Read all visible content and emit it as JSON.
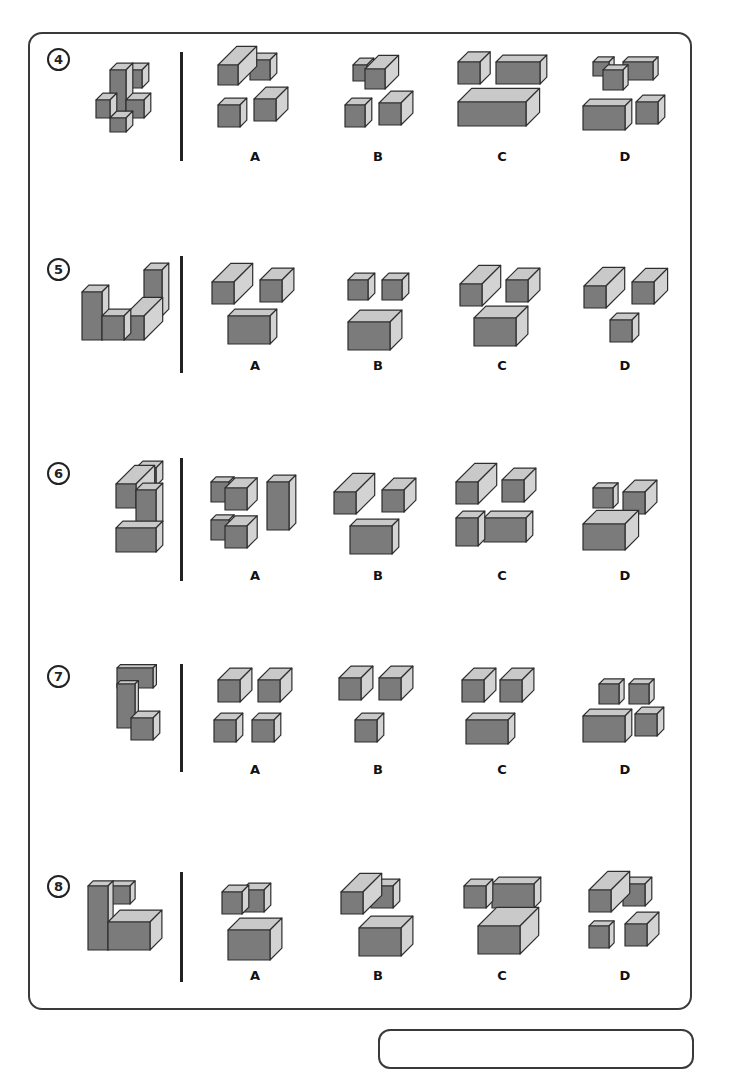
{
  "colors": {
    "front": "#7b7b7b",
    "top": "#c9c9c9",
    "side": "#d3d3d3",
    "outline": "#2e2e2e",
    "frame": "#3a3a3a"
  },
  "option_labels": [
    "A",
    "B",
    "C",
    "D"
  ],
  "questions": [
    {
      "number": "4",
      "circle_y": 48,
      "divider": [
        52,
        161
      ],
      "label_y": 149,
      "target": {
        "origin": [
          96,
          70
        ],
        "boxes": [
          [
            0,
            30,
            14,
            18,
            8
          ],
          [
            30,
            30,
            18,
            18,
            8
          ],
          [
            14,
            0,
            16,
            48,
            8
          ],
          [
            30,
            0,
            16,
            18,
            8
          ],
          [
            14,
            48,
            16,
            14,
            8
          ]
        ]
      },
      "options": [
        {
          "origin": [
            218,
            55
          ],
          "boxes": [
            [
              0,
              10,
              20,
              20,
              22
            ],
            [
              32,
              5,
              20,
              20,
              8
            ],
            [
              0,
              50,
              22,
              22,
              8
            ],
            [
              36,
              44,
              22,
              22,
              14
            ]
          ]
        },
        {
          "origin": [
            345,
            55
          ],
          "boxes": [
            [
              8,
              10,
              14,
              16,
              8
            ],
            [
              20,
              14,
              20,
              20,
              16
            ],
            [
              0,
              50,
              20,
              22,
              8
            ],
            [
              34,
              48,
              22,
              22,
              14
            ]
          ]
        },
        {
          "origin": [
            458,
            52
          ],
          "boxes": [
            [
              0,
              10,
              22,
              22,
              12
            ],
            [
              38,
              10,
              44,
              22,
              8
            ],
            [
              0,
              50,
              68,
              24,
              16
            ]
          ]
        },
        {
          "origin": [
            583,
            56
          ],
          "boxes": [
            [
              10,
              6,
              16,
              14,
              6
            ],
            [
              20,
              14,
              20,
              20,
              6
            ],
            [
              40,
              6,
              30,
              18,
              6
            ],
            [
              0,
              50,
              42,
              24,
              8
            ],
            [
              53,
              46,
              22,
              22,
              8
            ]
          ]
        }
      ]
    },
    {
      "number": "5",
      "circle_y": 258,
      "divider": [
        256,
        373
      ],
      "label_y": 358,
      "target": {
        "origin": [
          82,
          260
        ],
        "boxes": [
          [
            0,
            32,
            20,
            48,
            8
          ],
          [
            20,
            56,
            22,
            24,
            8
          ],
          [
            42,
            56,
            20,
            24,
            22
          ],
          [
            62,
            10,
            18,
            46,
            8
          ]
        ]
      },
      "options": [
        {
          "origin": [
            212,
            268
          ],
          "boxes": [
            [
              0,
              14,
              22,
              22,
              22
            ],
            [
              48,
              12,
              22,
              22,
              14
            ],
            [
              16,
              48,
              42,
              28,
              8
            ]
          ]
        },
        {
          "origin": [
            348,
            272
          ],
          "boxes": [
            [
              0,
              8,
              20,
              20,
              8
            ],
            [
              34,
              8,
              20,
              20,
              8
            ],
            [
              0,
              50,
              42,
              28,
              14
            ]
          ]
        },
        {
          "origin": [
            460,
            268
          ],
          "boxes": [
            [
              0,
              16,
              22,
              22,
              22
            ],
            [
              46,
              12,
              22,
              22,
              14
            ],
            [
              14,
              50,
              42,
              28,
              14
            ]
          ]
        },
        {
          "origin": [
            584,
            268
          ],
          "boxes": [
            [
              0,
              18,
              22,
              22,
              22
            ],
            [
              48,
              14,
              22,
              22,
              16
            ],
            [
              26,
              52,
              22,
              22,
              8
            ]
          ]
        }
      ]
    },
    {
      "number": "6",
      "circle_y": 462,
      "divider": [
        458,
        581
      ],
      "label_y": 568,
      "target": {
        "origin": [
          116,
          460
        ],
        "boxes": [
          [
            0,
            68,
            40,
            24,
            8
          ],
          [
            20,
            30,
            20,
            38,
            8
          ],
          [
            0,
            24,
            20,
            24,
            22
          ],
          [
            20,
            8,
            20,
            18,
            8
          ]
        ]
      },
      "options": [
        {
          "origin": [
            211,
            474
          ],
          "boxes": [
            [
              0,
              8,
              18,
              20,
              6
            ],
            [
              14,
              14,
              22,
              22,
              12
            ],
            [
              0,
              46,
              18,
              20,
              6
            ],
            [
              14,
              52,
              22,
              22,
              12
            ],
            [
              56,
              8,
              22,
              48,
              8
            ]
          ]
        },
        {
          "origin": [
            334,
            474
          ],
          "boxes": [
            [
              0,
              18,
              22,
              22,
              22
            ],
            [
              48,
              16,
              22,
              22,
              14
            ],
            [
              16,
              52,
              42,
              28,
              8
            ]
          ]
        },
        {
          "origin": [
            456,
            464
          ],
          "boxes": [
            [
              0,
              18,
              22,
              22,
              22
            ],
            [
              46,
              16,
              22,
              22,
              14
            ],
            [
              0,
              54,
              22,
              28,
              8
            ],
            [
              28,
              54,
              42,
              24,
              8
            ]
          ]
        },
        {
          "origin": [
            583,
            480
          ],
          "boxes": [
            [
              10,
              8,
              20,
              20,
              6
            ],
            [
              40,
              12,
              22,
              22,
              14
            ],
            [
              0,
              44,
              42,
              26,
              16
            ]
          ]
        }
      ]
    },
    {
      "number": "7",
      "circle_y": 665,
      "divider": [
        664,
        772
      ],
      "label_y": 762,
      "target": {
        "origin": [
          117,
          664
        ],
        "boxes": [
          [
            0,
            20,
            18,
            44,
            4
          ],
          [
            0,
            4,
            36,
            20,
            4
          ],
          [
            14,
            54,
            22,
            22,
            8
          ]
        ]
      },
      "options": [
        {
          "origin": [
            214,
            670
          ],
          "boxes": [
            [
              4,
              10,
              22,
              22,
              14
            ],
            [
              44,
              10,
              22,
              22,
              14
            ],
            [
              0,
              50,
              22,
              22,
              8
            ],
            [
              38,
              50,
              22,
              22,
              8
            ]
          ]
        },
        {
          "origin": [
            339,
            668
          ],
          "boxes": [
            [
              0,
              10,
              22,
              22,
              14
            ],
            [
              40,
              10,
              22,
              22,
              14
            ],
            [
              16,
              52,
              22,
              22,
              8
            ]
          ]
        },
        {
          "origin": [
            462,
            670
          ],
          "boxes": [
            [
              0,
              10,
              22,
              22,
              14
            ],
            [
              38,
              10,
              22,
              22,
              14
            ],
            [
              4,
              50,
              42,
              24,
              8
            ]
          ]
        },
        {
          "origin": [
            583,
            676
          ],
          "boxes": [
            [
              16,
              8,
              20,
              20,
              6
            ],
            [
              46,
              8,
              20,
              20,
              6
            ],
            [
              0,
              40,
              42,
              26,
              8
            ],
            [
              52,
              38,
              22,
              22,
              8
            ]
          ]
        }
      ]
    },
    {
      "number": "8",
      "circle_y": 875,
      "divider": [
        872,
        982
      ],
      "label_y": 968,
      "target": {
        "origin": [
          88,
          878
        ],
        "boxes": [
          [
            0,
            8,
            20,
            64,
            6
          ],
          [
            20,
            8,
            22,
            18,
            6
          ],
          [
            20,
            44,
            42,
            28,
            14
          ]
        ]
      },
      "options": [
        {
          "origin": [
            222,
            880
          ],
          "boxes": [
            [
              0,
              12,
              20,
              22,
              8
            ],
            [
              20,
              10,
              22,
              22,
              8
            ],
            [
              6,
              50,
              42,
              30,
              14
            ]
          ]
        },
        {
          "origin": [
            341,
            876
          ],
          "boxes": [
            [
              0,
              16,
              22,
              22,
              22
            ],
            [
              30,
              10,
              22,
              22,
              8
            ],
            [
              18,
              52,
              42,
              28,
              14
            ]
          ]
        },
        {
          "origin": [
            464,
            872
          ],
          "boxes": [
            [
              0,
              14,
              22,
              22,
              8
            ],
            [
              28,
              12,
              42,
              24,
              8
            ],
            [
              14,
              54,
              42,
              28,
              22
            ]
          ]
        },
        {
          "origin": [
            589,
            872
          ],
          "boxes": [
            [
              0,
              18,
              22,
              22,
              22
            ],
            [
              34,
              12,
              22,
              22,
              8
            ],
            [
              0,
              54,
              20,
              22,
              6
            ],
            [
              36,
              52,
              22,
              22,
              14
            ]
          ]
        }
      ]
    }
  ]
}
